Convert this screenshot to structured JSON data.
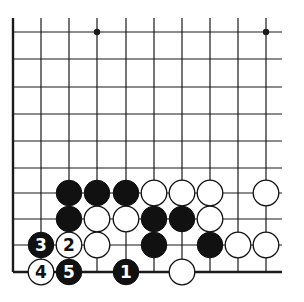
{
  "diagram": {
    "type": "go-board-fragment",
    "colors": {
      "background": "#ffffff",
      "line": "#1a1a1a",
      "black": "#111111",
      "white": "#ffffff"
    },
    "grid": {
      "x": [
        13,
        41,
        69,
        97,
        126,
        154,
        182,
        210,
        238,
        266
      ],
      "y": [
        32,
        59,
        87,
        114,
        141,
        168,
        193,
        219,
        245,
        272
      ],
      "right_extent": 282,
      "top_extent": 18,
      "bottom_edge": true,
      "left_edge": true
    },
    "star_points": [
      [
        3,
        0
      ],
      [
        9,
        0
      ]
    ],
    "stones": [
      {
        "c": 2,
        "r": 6,
        "color": "black"
      },
      {
        "c": 3,
        "r": 6,
        "color": "black"
      },
      {
        "c": 4,
        "r": 6,
        "color": "black"
      },
      {
        "c": 5,
        "r": 6,
        "color": "white"
      },
      {
        "c": 6,
        "r": 6,
        "color": "white"
      },
      {
        "c": 7,
        "r": 6,
        "color": "white"
      },
      {
        "c": 9,
        "r": 6,
        "color": "white"
      },
      {
        "c": 2,
        "r": 7,
        "color": "black"
      },
      {
        "c": 3,
        "r": 7,
        "color": "white"
      },
      {
        "c": 4,
        "r": 7,
        "color": "white"
      },
      {
        "c": 5,
        "r": 7,
        "color": "black"
      },
      {
        "c": 6,
        "r": 7,
        "color": "black"
      },
      {
        "c": 7,
        "r": 7,
        "color": "white"
      },
      {
        "c": 1,
        "r": 8,
        "color": "black",
        "label": "3"
      },
      {
        "c": 2,
        "r": 8,
        "color": "white",
        "label": "2"
      },
      {
        "c": 3,
        "r": 8,
        "color": "white"
      },
      {
        "c": 5,
        "r": 8,
        "color": "black"
      },
      {
        "c": 7,
        "r": 8,
        "color": "black"
      },
      {
        "c": 8,
        "r": 8,
        "color": "white"
      },
      {
        "c": 9,
        "r": 8,
        "color": "white"
      },
      {
        "c": 1,
        "r": 9,
        "color": "white",
        "label": "4"
      },
      {
        "c": 2,
        "r": 9,
        "color": "black",
        "label": "5"
      },
      {
        "c": 4,
        "r": 9,
        "color": "black",
        "label": "1"
      },
      {
        "c": 6,
        "r": 9,
        "color": "white"
      }
    ]
  }
}
